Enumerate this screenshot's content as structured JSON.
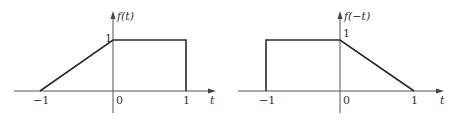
{
  "plots": [
    {
      "id": "left",
      "function_label": "f(t)",
      "x_axis_label": "t",
      "ticks": {
        "neg_one": "−1",
        "zero": "0",
        "one": "1"
      },
      "y_tick": "1",
      "points": [
        [
          -1,
          0
        ],
        [
          0,
          1
        ],
        [
          1,
          1
        ],
        [
          1,
          0
        ]
      ],
      "colors": {
        "signal": "#2a2a2a",
        "axis": "#555555"
      }
    },
    {
      "id": "right",
      "function_label": "f(−t)",
      "x_axis_label": "t",
      "ticks": {
        "neg_one": "−1",
        "zero": "0",
        "one": "1"
      },
      "y_tick": "1",
      "points": [
        [
          -1,
          0
        ],
        [
          -1,
          1
        ],
        [
          0,
          1
        ],
        [
          1,
          0
        ]
      ],
      "colors": {
        "signal": "#2a2a2a",
        "axis": "#555555"
      }
    }
  ]
}
